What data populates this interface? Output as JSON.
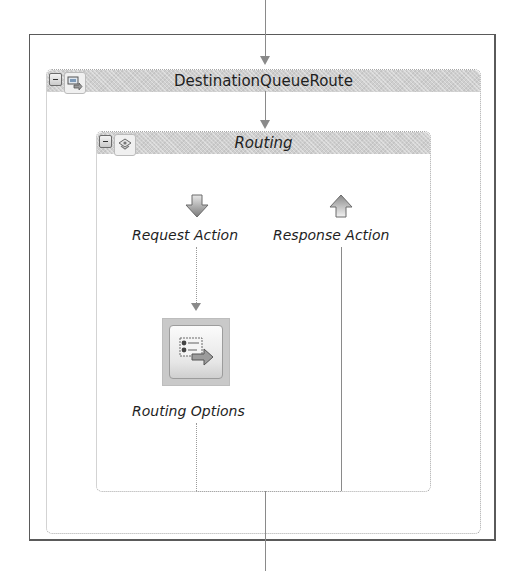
{
  "diagram": {
    "outer_stage": {
      "title": "DestinationQueueRoute",
      "collapse_symbol": "−",
      "icon": "pipeline-stage-icon"
    },
    "inner_stage": {
      "title": "Routing",
      "collapse_symbol": "−",
      "icon": "routing-stage-icon"
    },
    "actions": [
      {
        "label": "Request Action",
        "icon": "down-arrow-icon"
      },
      {
        "label": "Response Action",
        "icon": "up-arrow-icon"
      }
    ],
    "routing_node": {
      "label": "Routing Options",
      "icon": "routing-options-icon"
    },
    "colors": {
      "header_fill": "#cfcfcf",
      "connector": "#8a8a8a",
      "border": "#5a5a5a"
    }
  }
}
